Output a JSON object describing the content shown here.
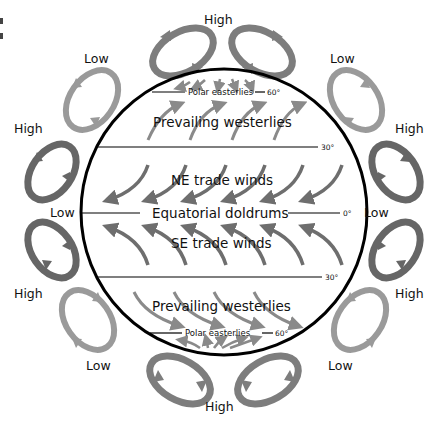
{
  "pressure_labels": {
    "top": "High",
    "bottom": "High",
    "left_upper_low": "Low",
    "left_upper_high": "High",
    "left_equator": "Low",
    "left_lower_high": "High",
    "left_lower_low": "Low",
    "right_upper_low": "Low",
    "right_upper_high": "High",
    "right_equator": "Low",
    "right_lower_high": "High",
    "right_lower_low": "Low"
  },
  "wind_belts": {
    "north_polar": "Polar easterlies",
    "north_westerlies": "Prevailing westerlies",
    "ne_trades": "NE trade winds",
    "equator": "Equatorial doldrums",
    "se_trades": "SE trade winds",
    "south_westerlies": "Prevailing westerlies",
    "south_polar": "Polar easterlies"
  },
  "latitudes": {
    "north_60": "60°",
    "north_30": "30°",
    "equator": "0°",
    "south_30": "30°",
    "south_60": "60°"
  },
  "colors": {
    "globe_outline": "#000000",
    "cell_light": "#9a9a9a",
    "cell_mid": "#7d7d7d",
    "cell_dark": "#666666",
    "wind_arrow": "#6e6e6e",
    "polar_arrow": "#8a8a8a"
  }
}
